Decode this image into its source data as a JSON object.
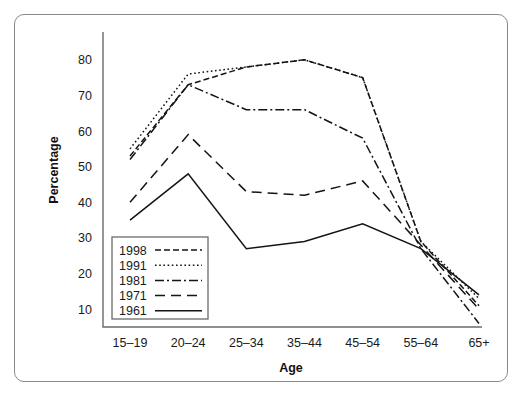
{
  "chart_data": {
    "type": "line",
    "title": "",
    "xlabel": "Age",
    "ylabel": "Percentage",
    "categories": [
      "15–19",
      "20–24",
      "25–34",
      "35–44",
      "45–54",
      "55–64",
      "65+"
    ],
    "ylim": [
      5,
      85
    ],
    "yticks": [
      10,
      20,
      30,
      40,
      50,
      60,
      70,
      80
    ],
    "ytick_labels": [
      "10",
      "20",
      "30",
      "40",
      "50",
      "60",
      "70",
      "80"
    ],
    "grid": false,
    "legend_position": "bottom-left",
    "series": [
      {
        "name": "1998",
        "dash": "dashed",
        "dasharray": "6,3",
        "values": [
          53,
          73,
          78,
          80,
          75,
          29,
          11
        ]
      },
      {
        "name": "1991",
        "dash": "dotted",
        "dasharray": "1.6,2.6",
        "values": [
          55,
          76,
          78,
          80,
          75,
          29,
          13
        ]
      },
      {
        "name": "1981",
        "dash": "dash-dot",
        "dasharray": "9,3,2,3",
        "values": [
          52,
          73,
          66,
          66,
          58,
          27,
          6
        ]
      },
      {
        "name": "1971",
        "dash": "long-dash",
        "dasharray": "10,6",
        "values": [
          40,
          59,
          43,
          42,
          46,
          28,
          10
        ]
      },
      {
        "name": "1961",
        "dash": "solid",
        "dasharray": "",
        "values": [
          35,
          48,
          27,
          29,
          34,
          27,
          14
        ]
      }
    ],
    "colors": {
      "line": "#141414",
      "axis": "#6b6b6b",
      "text": "#1a1a1a",
      "background": "#ffffff",
      "frame": "#8a8a8a"
    }
  }
}
